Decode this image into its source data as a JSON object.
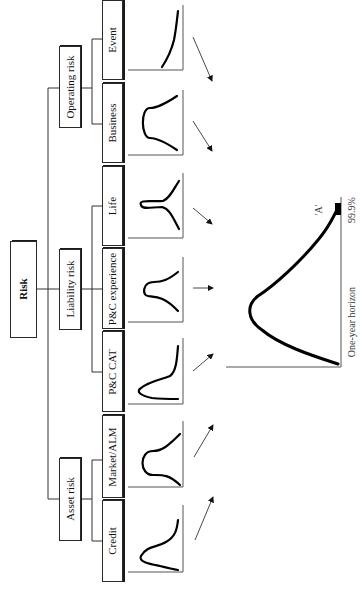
{
  "diagram": {
    "title": "Risk",
    "orientation": "rotated 90 degrees clockwise (landscape figure on portrait page)",
    "categories": [
      {
        "label": "Operating risk",
        "children": [
          {
            "label": "Event",
            "distribution_shape": "steep tail rising curve"
          },
          {
            "label": "Business",
            "distribution_shape": "bell curve"
          }
        ]
      },
      {
        "label": "Liability risk",
        "children": [
          {
            "label": "Life",
            "distribution_shape": "sharp peaked (leptokurtic) curve"
          },
          {
            "label": "P&C experience",
            "distribution_shape": "bell curve"
          },
          {
            "label": "P&C CAT",
            "distribution_shape": "skewed curve with heavy tail"
          }
        ]
      },
      {
        "label": "Asset risk",
        "children": [
          {
            "label": "Market/ALM",
            "distribution_shape": "bell curve"
          },
          {
            "label": "Credit",
            "distribution_shape": "skewed curve with fat tail"
          }
        ]
      }
    ],
    "aggregate": {
      "description": "Aggregated loss distribution",
      "horizon_label": "One-year horizon",
      "percentile_label": "99.9%",
      "rating_label": "'A'"
    }
  },
  "labels": {
    "risk": "Risk",
    "operating": "Operating risk",
    "liability": "Liability risk",
    "asset": "Asset risk",
    "event": "Event",
    "business": "Business",
    "life": "Life",
    "pc_experience": "P&C experience",
    "pc_cat": "P&C CAT",
    "market_alm": "Market/ALM",
    "credit": "Credit",
    "horizon": "One-year horizon",
    "percentile": "99.9%",
    "rating": "'A'"
  }
}
